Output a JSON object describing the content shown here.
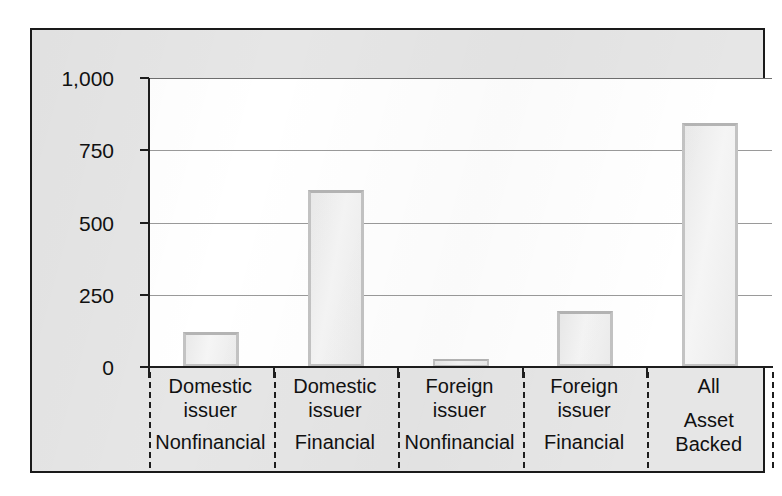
{
  "chart_data": {
    "type": "bar",
    "title": "",
    "subtitle": "",
    "xlabel": "",
    "ylabel": "",
    "ylim": [
      0,
      1000
    ],
    "yticks": [
      0,
      250,
      500,
      750,
      1000
    ],
    "ytick_labels": [
      "0",
      "250",
      "500",
      "750",
      "1,000"
    ],
    "grid": true,
    "legend": false,
    "categories": [
      "Domestic issuer Nonfinancial",
      "Domestic issuer Financial",
      "Foreign issuer Nonfinancial",
      "Foreign issuer Financial",
      "All Asset Backed"
    ],
    "values": [
      121,
      614,
      28,
      193,
      843
    ],
    "bar_fill": "#f1f1f1",
    "bar_edge": "#c3c3c3"
  },
  "axis": {
    "y_ticks": [
      {
        "label": "1,000",
        "value": 1000
      },
      {
        "label": "750",
        "value": 750
      },
      {
        "label": "500",
        "value": 500
      },
      {
        "label": "250",
        "value": 250
      },
      {
        "label": "0",
        "value": 0
      }
    ]
  },
  "categories": [
    {
      "top_line1": "Domestic",
      "top_line2": "issuer",
      "bottom_line1": "Nonfinancial",
      "bottom_line2": "",
      "value": 121
    },
    {
      "top_line1": "Domestic",
      "top_line2": "issuer",
      "bottom_line1": "Financial",
      "bottom_line2": "",
      "value": 614
    },
    {
      "top_line1": "Foreign",
      "top_line2": "issuer",
      "bottom_line1": "Nonfinancial",
      "bottom_line2": "",
      "value": 28
    },
    {
      "top_line1": "Foreign",
      "top_line2": "issuer",
      "bottom_line1": "Financial",
      "bottom_line2": "",
      "value": 193
    },
    {
      "top_line1": "All",
      "top_line2": "",
      "bottom_line1": "Asset",
      "bottom_line2": "Backed",
      "value": 843
    }
  ]
}
